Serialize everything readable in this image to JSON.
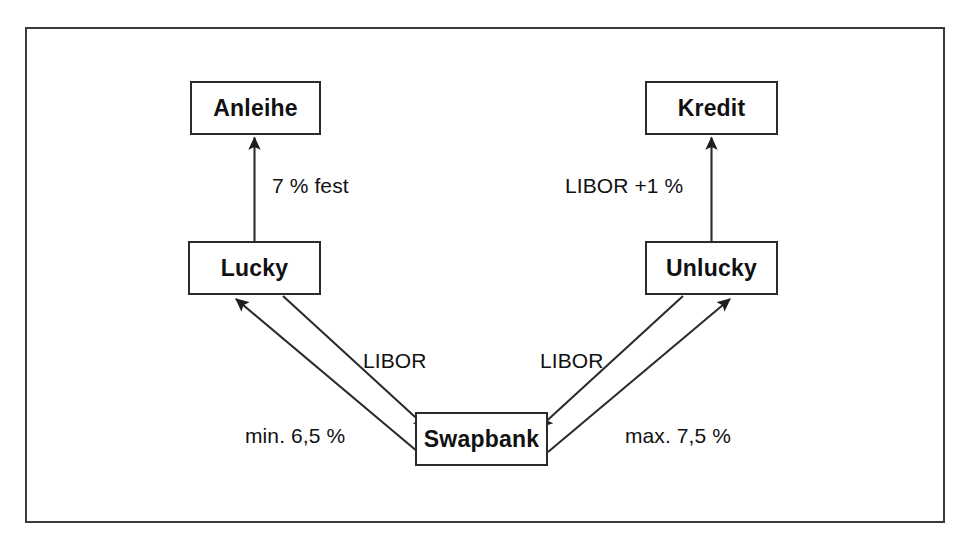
{
  "diagram": {
    "frame": {
      "name": "outer-frame",
      "x": 25,
      "y": 27,
      "width": 920,
      "height": 496,
      "border_color": "#3a3a3a"
    },
    "nodes": [
      {
        "id": "anleihe",
        "label": "Anleihe",
        "x": 190,
        "y": 81,
        "width": 131,
        "height": 54
      },
      {
        "id": "kredit",
        "label": "Kredit",
        "x": 645,
        "y": 81,
        "width": 133,
        "height": 54
      },
      {
        "id": "lucky",
        "label": "Lucky",
        "x": 188,
        "y": 241,
        "width": 133,
        "height": 54
      },
      {
        "id": "unlucky",
        "label": "Unlucky",
        "x": 645,
        "y": 241,
        "width": 133,
        "height": 54
      },
      {
        "id": "swapbank",
        "label": "Swapbank",
        "x": 415,
        "y": 412,
        "width": 133,
        "height": 54
      }
    ],
    "edges": [
      {
        "id": "lucky-to-anleihe",
        "from": "lucky",
        "to": "anleihe",
        "label": "7 % fest"
      },
      {
        "id": "unlucky-to-kredit",
        "from": "unlucky",
        "to": "kredit",
        "label": "LIBOR +1 %"
      },
      {
        "id": "lucky-to-swapbank",
        "from": "lucky",
        "to": "swapbank",
        "label": "LIBOR"
      },
      {
        "id": "swapbank-to-lucky",
        "from": "swapbank",
        "to": "lucky",
        "label": "min. 6,5 %"
      },
      {
        "id": "unlucky-to-swapbank",
        "from": "unlucky",
        "to": "swapbank",
        "label": "LIBOR"
      },
      {
        "id": "swapbank-to-unlucky",
        "from": "swapbank",
        "to": "unlucky",
        "label": "max. 7,5 %"
      }
    ],
    "edge_labels": [
      {
        "id": "label-7-fest",
        "text": "7 % fest",
        "x": 272,
        "y": 174
      },
      {
        "id": "label-libor-plus",
        "text": "LIBOR +1 %",
        "x": 565,
        "y": 174
      },
      {
        "id": "label-libor-left",
        "text": "LIBOR",
        "x": 363,
        "y": 349
      },
      {
        "id": "label-libor-right",
        "text": "LIBOR",
        "x": 540,
        "y": 349
      },
      {
        "id": "label-min-65",
        "text": "min. 6,5 %",
        "x": 245,
        "y": 424
      },
      {
        "id": "label-max-75",
        "text": "max. 7,5 %",
        "x": 625,
        "y": 424
      }
    ],
    "colors": {
      "stroke": "#2b2b2b",
      "frame": "#3a3a3a",
      "text": "#111111",
      "background": "#ffffff"
    }
  }
}
